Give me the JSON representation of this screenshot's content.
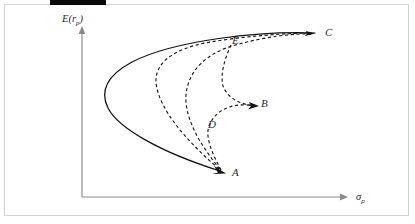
{
  "figure": {
    "title_bar_present": true,
    "background_color": "#ffffff",
    "frame_color": "#d2d2d2",
    "top_bar_color": "#0a0a0a",
    "curve_color": "#111111",
    "axis_color": "#8a8a8a"
  },
  "axes": {
    "y_label_main": "E",
    "y_label_open": "(",
    "y_label_var": "r",
    "y_label_sub": "p",
    "y_label_close": ")",
    "y_label_full": "E(r_p)",
    "x_label_var": "σ",
    "x_label_sub": "p",
    "x_label_full": "σ_p"
  },
  "points": [
    {
      "id": "A",
      "label": "A",
      "x": 232,
      "y": 176
    },
    {
      "id": "B",
      "label": "B",
      "x": 261,
      "y": 107
    },
    {
      "id": "C",
      "label": "C",
      "x": 325,
      "y": 36
    },
    {
      "id": "D",
      "label": "D",
      "x": 208,
      "y": 128
    },
    {
      "id": "E",
      "label": "E",
      "x": 232,
      "y": 44
    }
  ],
  "chart_data": {
    "type": "line",
    "title": "",
    "xlabel": "σ_p",
    "ylabel": "E(r_p)",
    "grid": false,
    "legend": null,
    "annotations": [
      "A",
      "B",
      "C",
      "D",
      "E"
    ],
    "series": [
      {
        "name": "efficient-frontier-envelope",
        "style": "solid",
        "path": "M 315 33 C 260 31 175 40 132 62 C 106 76 100 92 108 108 C 118 128 160 152 220 171"
      },
      {
        "name": "dashed-curve-A-to-C-outer",
        "style": "dashed",
        "path": "M 219 169 C 190 144 158 110 156 82 C 155 62 175 49 205 43 C 243 36 290 33 312 33"
      },
      {
        "name": "dashed-curve-A-to-C-inner",
        "style": "dashed",
        "path": "M 220 169 C 204 150 184 120 186 95 C 188 71 206 54 232 46 C 262 37 295 33 312 34"
      },
      {
        "name": "dashed-curve-A-to-B",
        "style": "dashed",
        "path": "M 221 170 C 212 153 205 137 209 126 C 216 108 235 102 256 106"
      },
      {
        "name": "dashed-curve-E-to-B",
        "style": "dashed",
        "path": "M 231 45 C 225 58 220 74 223 86 C 228 99 242 105 256 106"
      }
    ]
  }
}
